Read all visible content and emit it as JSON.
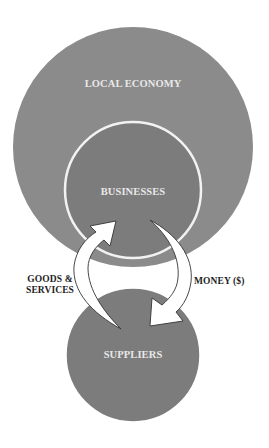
{
  "diagram": {
    "background": "#ffffff",
    "nodes": [
      {
        "id": "local-economy",
        "label": "LOCAL ECONOMY",
        "cx": 133,
        "cy": 147,
        "r": 120,
        "fill": "#8b8b8b",
        "stroke": "none",
        "label_x": 133,
        "label_y": 83
      },
      {
        "id": "businesses",
        "label": "BUSINESSES",
        "cx": 133,
        "cy": 190,
        "r": 68,
        "fill": "#7c7c7c",
        "stroke": "#f2f2f2",
        "label_x": 133,
        "label_y": 191
      },
      {
        "id": "suppliers",
        "label": "SUPPLIERS",
        "cx": 133,
        "cy": 355,
        "r": 67,
        "fill": "#7c7c7c",
        "stroke": "#ffffff",
        "label_x": 133,
        "label_y": 354
      }
    ],
    "flows": [
      {
        "id": "goods-services",
        "from": "suppliers",
        "to": "businesses",
        "label_lines": [
          "GOODS &",
          "SERVICES"
        ],
        "arrow_fill": "#ffffff",
        "arrow_stroke": "#333333"
      },
      {
        "id": "money",
        "from": "businesses",
        "to": "suppliers",
        "label_lines": [
          "MONEY ($)"
        ],
        "arrow_fill": "#ffffff",
        "arrow_stroke": "#333333"
      }
    ],
    "text_color_inner": "#e8e8e8",
    "text_color_outer": "#1e1e1e"
  }
}
